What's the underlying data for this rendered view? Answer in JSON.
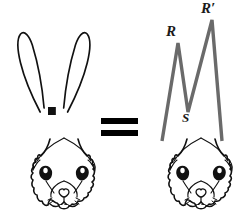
{
  "figure": {
    "type": "geometry-equivalence-diagram",
    "background_color": "#ffffff",
    "ink_color": "#111111",
    "zigzag_color": "#6a6a6a",
    "zigzag_width": 3.4
  },
  "left_figure": {
    "name": "rabbit-head-with-ears",
    "caption": ""
  },
  "relation": {
    "symbol": "=",
    "name": "equals-sign",
    "bar_color": "#000000"
  },
  "right_figure": {
    "name": "rabbit-head-with-zigzag-ears",
    "caption": ""
  },
  "labels": {
    "R": "R",
    "R_prime": "R′",
    "S": "S"
  },
  "vertices": {
    "R": {
      "x": 178,
      "y": 43,
      "label": "R"
    },
    "S": {
      "x": 188,
      "y": 112,
      "label": "S"
    },
    "R_prime": {
      "x": 212,
      "y": 20,
      "label": "R′"
    },
    "left_foot": {
      "x": 162,
      "y": 141
    },
    "right_foot": {
      "x": 222,
      "y": 141
    }
  }
}
